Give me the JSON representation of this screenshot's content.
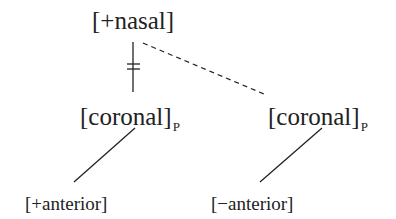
{
  "diagram": {
    "type": "feature-geometry",
    "nodes": {
      "nasal": {
        "label": "[+nasal]"
      },
      "coronal_left": {
        "label": "[coronal]",
        "subscript": "P"
      },
      "coronal_right": {
        "label": "[coronal]",
        "subscript": "P"
      },
      "anterior_plus": {
        "label": "[+anterior]"
      },
      "anterior_minus": {
        "label": "[−anterior]"
      }
    },
    "edges": [
      {
        "from": "nasal",
        "to": "coronal_left",
        "style": "solid",
        "delinked": true
      },
      {
        "from": "nasal",
        "to": "coronal_right",
        "style": "dashed"
      },
      {
        "from": "coronal_left",
        "to": "anterior_plus",
        "style": "solid"
      },
      {
        "from": "coronal_right",
        "to": "anterior_minus",
        "style": "solid"
      }
    ],
    "colors": {
      "ink": "#222222",
      "background": "#ffffff"
    }
  }
}
